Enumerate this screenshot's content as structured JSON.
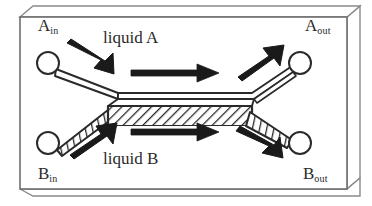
{
  "figure": {
    "background_color": "#ffffff",
    "line_color": "#2a2a2a",
    "fill_color": "#ffffff",
    "frame": {
      "name": "3d-device-housing",
      "front_face": {
        "x": 20,
        "y": 17,
        "width": 327,
        "height": 172
      },
      "depth_x": 13,
      "depth_y": -11
    },
    "ports": [
      {
        "id": "a-in",
        "label_text": "A",
        "label_sub": "in",
        "cx": 48,
        "cy": 63,
        "r": 11
      },
      {
        "id": "a-out",
        "label_text": "A",
        "label_sub": "out",
        "cx": 300,
        "cy": 63,
        "r": 11
      },
      {
        "id": "b-in",
        "label_text": "B",
        "label_sub": "in",
        "cx": 48,
        "cy": 143,
        "r": 11
      },
      {
        "id": "b-out",
        "label_text": "B",
        "label_sub": "out",
        "cx": 300,
        "cy": 143,
        "r": 11
      }
    ],
    "labels": {
      "a_in": "A",
      "a_in_sub": "in",
      "a_out": "A",
      "a_out_sub": "out",
      "b_in": "B",
      "b_in_sub": "in",
      "b_out": "B",
      "b_out_sub": "out",
      "liquid_a": "liquid A",
      "liquid_b": "liquid B"
    },
    "channels": [
      {
        "name": "inlet-channel-a",
        "style": "plain",
        "from": "a-in",
        "to": "junction-left",
        "direction": "down-right"
      },
      {
        "name": "inlet-channel-b",
        "style": "hatched",
        "from": "b-in",
        "to": "junction-left",
        "direction": "up-right"
      },
      {
        "name": "contact-channel-a",
        "style": "plain",
        "from": "junction-left",
        "to": "junction-right",
        "direction": "right"
      },
      {
        "name": "contact-channel-b",
        "style": "hatched",
        "from": "junction-left",
        "to": "junction-right",
        "direction": "right"
      },
      {
        "name": "outlet-channel-a",
        "style": "plain",
        "from": "junction-right",
        "to": "a-out",
        "direction": "up-right"
      },
      {
        "name": "outlet-channel-b",
        "style": "hatched",
        "from": "junction-right",
        "to": "b-out",
        "direction": "down-right"
      }
    ],
    "flow_arrows": [
      {
        "name": "flow-arrow-inlet-a",
        "direction": "down-right"
      },
      {
        "name": "flow-arrow-channel-a",
        "direction": "right"
      },
      {
        "name": "flow-arrow-outlet-a",
        "direction": "up-right"
      },
      {
        "name": "flow-arrow-inlet-b",
        "direction": "up-right"
      },
      {
        "name": "flow-arrow-channel-b",
        "direction": "right"
      },
      {
        "name": "flow-arrow-outlet-b",
        "direction": "down-right"
      }
    ]
  }
}
